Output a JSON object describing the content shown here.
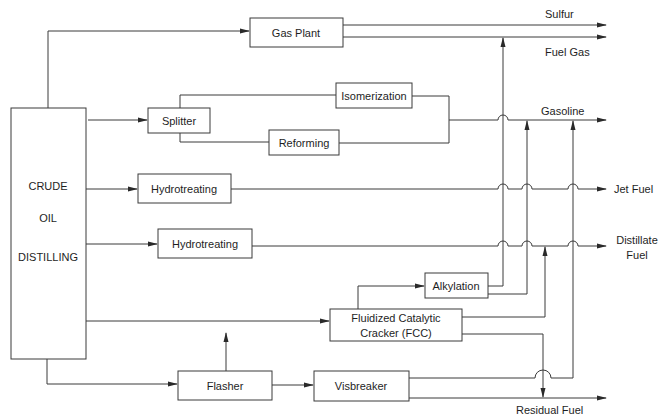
{
  "diagram": {
    "type": "refinery-process-flow",
    "units": {
      "crude": {
        "line1": "CRUDE",
        "line2": "OIL",
        "line3": "DISTILLING"
      },
      "gas_plant": "Gas Plant",
      "splitter": "Splitter",
      "isomerization": "Isomerization",
      "reforming": "Reforming",
      "hydrotreating_1": "Hydrotreating",
      "hydrotreating_2": "Hydrotreating",
      "alkylation": "Alkylation",
      "fcc": {
        "line1": "Fluidized Catalytic",
        "line2": "Cracker (FCC)"
      },
      "flasher": "Flasher",
      "visbreaker": "Visbreaker"
    },
    "products": {
      "sulfur": "Sulfur",
      "fuel_gas": "Fuel Gas",
      "gasoline": "Gasoline",
      "jet_fuel": "Jet Fuel",
      "distillate": {
        "line1": "Distillate",
        "line2": "Fuel"
      },
      "residual": "Residual Fuel"
    },
    "flows": [
      {
        "from": "Crude Oil Distilling",
        "to": "Gas Plant"
      },
      {
        "from": "Crude Oil Distilling",
        "to": "Splitter"
      },
      {
        "from": "Crude Oil Distilling",
        "to": "Hydrotreating (1)"
      },
      {
        "from": "Crude Oil Distilling",
        "to": "Hydrotreating (2)"
      },
      {
        "from": "Crude Oil Distilling",
        "to": "Fluidized Catalytic Cracker (FCC)"
      },
      {
        "from": "Crude Oil Distilling",
        "to": "Flasher"
      },
      {
        "from": "Gas Plant",
        "to": "Sulfur"
      },
      {
        "from": "Gas Plant",
        "to": "Fuel Gas"
      },
      {
        "from": "Splitter",
        "to": "Isomerization"
      },
      {
        "from": "Splitter",
        "to": "Reforming"
      },
      {
        "from": "Isomerization",
        "to": "Gasoline"
      },
      {
        "from": "Reforming",
        "to": "Gasoline"
      },
      {
        "from": "Hydrotreating (1)",
        "to": "Jet Fuel"
      },
      {
        "from": "Hydrotreating (2)",
        "to": "Distillate Fuel"
      },
      {
        "from": "FCC",
        "to": "Alkylation"
      },
      {
        "from": "Alkylation",
        "to": "Fuel Gas"
      },
      {
        "from": "Alkylation",
        "to": "Gasoline"
      },
      {
        "from": "FCC",
        "to": "Distillate Fuel"
      },
      {
        "from": "FCC",
        "to": "Residual Fuel"
      },
      {
        "from": "Flasher",
        "to": "FCC"
      },
      {
        "from": "Flasher",
        "to": "Visbreaker"
      },
      {
        "from": "Visbreaker",
        "to": "Gasoline"
      },
      {
        "from": "Visbreaker",
        "to": "Residual Fuel"
      }
    ]
  }
}
